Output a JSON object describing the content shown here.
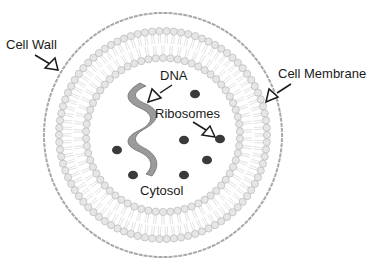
{
  "diagram": {
    "labels": {
      "cell_wall": "Cell Wall",
      "cell_membrane": "Cell Membrane",
      "dna": "DNA",
      "ribosomes": "Ribosomes",
      "cytosol": "Cytosol"
    },
    "ribosome_count": 7,
    "colors": {
      "wall": "#a8a8a8",
      "lipid_head_fill": "#e6e6e6",
      "lipid_head_stroke": "#b8b8b8",
      "lipid_tail": "#c4c4c4",
      "dna_fill": "#9a9a9a",
      "dna_stroke": "#6e6e6e",
      "ribosome": "#3a3a3a",
      "arrow": "#1a1a1a",
      "text": "#1a1a1a"
    }
  }
}
